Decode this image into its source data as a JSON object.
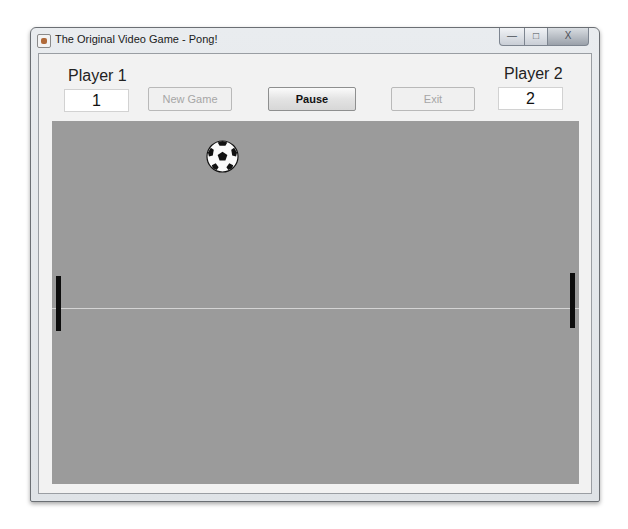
{
  "window": {
    "title": "The Original Video Game - Pong!",
    "controls": {
      "minimize": "—",
      "maximize": "□",
      "close": "X"
    }
  },
  "players": [
    {
      "label": "Player 1",
      "score": "1"
    },
    {
      "label": "Player 2",
      "score": "2"
    }
  ],
  "toolbar": {
    "new_game_label": "New Game",
    "pause_label": "Pause",
    "exit_label": "Exit"
  },
  "game": {
    "field_color": "#9b9b9b",
    "ball": {
      "icon": "soccer-ball-icon",
      "x": 171,
      "y": 36
    },
    "left_paddle": {
      "x": 4,
      "y": 155
    },
    "right_paddle": {
      "x": 518,
      "y": 152
    }
  }
}
